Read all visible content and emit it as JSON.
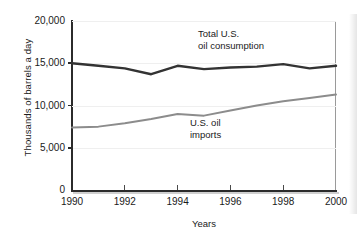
{
  "chart_data": {
    "type": "line",
    "title": "",
    "xlabel": "Years",
    "ylabel": "Thousands of barrels a day",
    "xlim": [
      1990,
      2000
    ],
    "ylim": [
      0,
      20000
    ],
    "grid": true,
    "legend_position": "inline-annotations",
    "x": [
      1990,
      1991,
      1992,
      1993,
      1994,
      1995,
      1996,
      1997,
      1998,
      1999,
      2000
    ],
    "xticks": [
      1990,
      1992,
      1994,
      1996,
      1998,
      2000
    ],
    "xtick_labels": [
      "1990",
      "1992",
      "1994",
      "1996",
      "1998",
      "2000"
    ],
    "yticks": [
      0,
      5000,
      10000,
      15000,
      20000
    ],
    "ytick_labels": [
      "0",
      "5,000",
      "10,000",
      "15,000",
      "20,000"
    ],
    "series": [
      {
        "name": "Total U.S. oil consumption",
        "annotation": "Total U.S.\noil consumption",
        "color": "#333333",
        "width": 2.4,
        "values": [
          15000,
          14700,
          14400,
          13700,
          14700,
          14300,
          14500,
          14600,
          14900,
          14400,
          14700
        ]
      },
      {
        "name": "U.S. oil imports",
        "annotation": "U.S. oil\nimports",
        "color": "#8c8c8c",
        "width": 2.0,
        "values": [
          7400,
          7500,
          7900,
          8400,
          9000,
          8800,
          9400,
          10000,
          10500,
          10900,
          11300
        ]
      }
    ]
  },
  "axes": {
    "ylabel": "Thousands of barrels a day",
    "xlabel": "Years"
  }
}
